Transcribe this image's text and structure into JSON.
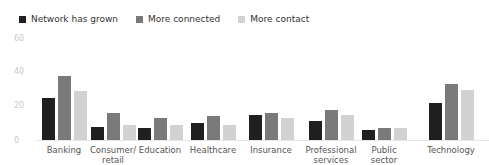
{
  "chart_data": {
    "type": "bar",
    "title": "",
    "xlabel": "",
    "ylabel": "",
    "ylim": [
      0,
      60
    ],
    "yticks": [
      0,
      20,
      40,
      60
    ],
    "grid": false,
    "legend_position": "top-left",
    "categories": [
      "Banking",
      "Consumer/ retail",
      "Education",
      "Healthcare",
      "Insurance",
      "Professional services",
      "Public sector",
      "Technology"
    ],
    "series": [
      {
        "name": "Network has grown",
        "color": "#1f1f1f",
        "values": [
          25,
          8,
          7,
          10,
          15,
          11,
          6,
          22
        ]
      },
      {
        "name": "More connected",
        "color": "#7a7a7a",
        "values": [
          38,
          16,
          13,
          14,
          16,
          18,
          7,
          33
        ]
      },
      {
        "name": "More contact",
        "color": "#d2d2d2",
        "values": [
          29,
          9,
          9,
          9,
          13,
          15,
          7,
          30
        ]
      }
    ]
  },
  "legend": {
    "items": [
      {
        "label": "Network has grown",
        "color": "#1f1f1f"
      },
      {
        "label": "More connected",
        "color": "#7a7a7a"
      },
      {
        "label": "More contact",
        "color": "#d2d2d2"
      }
    ]
  },
  "axis": {
    "y": [
      "60",
      "40",
      "20",
      "0"
    ]
  },
  "categories": [
    {
      "line1": "Banking",
      "line2": ""
    },
    {
      "line1": "Consumer/",
      "line2": "retail"
    },
    {
      "line1": "Education",
      "line2": ""
    },
    {
      "line1": "Healthcare",
      "line2": ""
    },
    {
      "line1": "Insurance",
      "line2": ""
    },
    {
      "line1": "Professional",
      "line2": "services"
    },
    {
      "line1": "Public",
      "line2": "sector"
    },
    {
      "line1": "Technology",
      "line2": ""
    }
  ]
}
